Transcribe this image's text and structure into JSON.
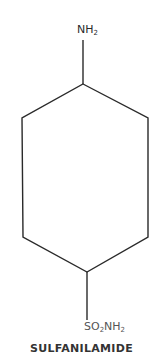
{
  "compound": {
    "name": "SULFANILAMIDE",
    "top_group": {
      "main": "NH",
      "subscript": "2"
    },
    "bottom_group": {
      "part1": "SO",
      "sub1": "2",
      "part2": "NH",
      "sub2": "2"
    }
  },
  "style": {
    "line_color": "#2a2a2a",
    "background": "#ffffff"
  }
}
